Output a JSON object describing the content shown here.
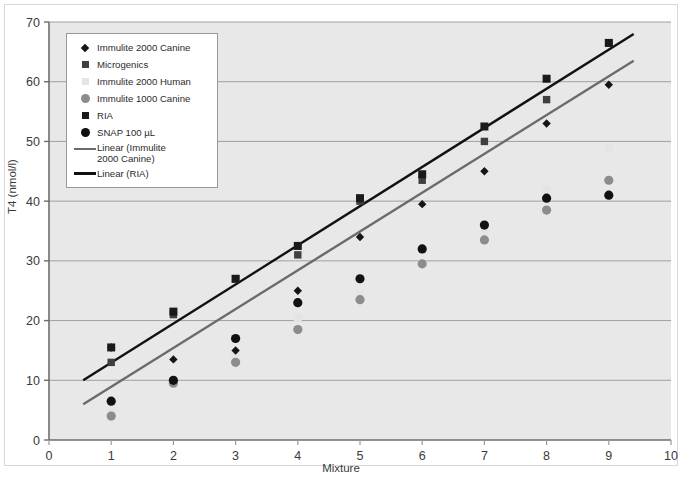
{
  "chart_data": {
    "type": "scatter",
    "title": "",
    "xlabel": "Mixture",
    "ylabel": "T4 (nmol/l)",
    "xlim": [
      0,
      10
    ],
    "ylim": [
      0,
      70
    ],
    "xticks": [
      0,
      1,
      2,
      3,
      4,
      5,
      6,
      7,
      8,
      9,
      10
    ],
    "yticks": [
      0,
      10,
      20,
      30,
      40,
      50,
      60,
      70
    ],
    "grid": "horizontal",
    "legend_position": "upper-left-inside",
    "x": [
      1,
      2,
      3,
      4,
      5,
      6,
      7,
      8,
      9
    ],
    "series": [
      {
        "name": "Immulite 2000 Canine",
        "marker": "diamond",
        "color": "#151515",
        "values": [
          15.5,
          13.5,
          15.0,
          25.0,
          34.0,
          39.5,
          45.0,
          53.0,
          59.5
        ]
      },
      {
        "name": "Microgenics",
        "marker": "square",
        "color": "#3f3f3f",
        "values": [
          13.0,
          21.0,
          27.0,
          31.0,
          40.0,
          43.5,
          50.0,
          57.0,
          66.5
        ]
      },
      {
        "name": "Immulite 2000 Human",
        "marker": "square",
        "color": "#e4e4e4",
        "values": [
          4.5,
          10.0,
          14.0,
          20.5,
          24.5,
          29.5,
          35.0,
          42.0,
          49.0
        ]
      },
      {
        "name": "Immulite 1000 Canine",
        "marker": "circle",
        "color": "#8c8c8c",
        "values": [
          4.0,
          9.5,
          13.0,
          18.5,
          23.5,
          29.5,
          33.5,
          38.5,
          43.5
        ]
      },
      {
        "name": "RIA",
        "marker": "square",
        "color": "#1a1a1a",
        "values": [
          15.5,
          21.5,
          27.0,
          32.5,
          40.5,
          44.5,
          52.5,
          60.5,
          66.5
        ]
      },
      {
        "name": "SNAP 100 µL",
        "marker": "circle",
        "color": "#111111",
        "values": [
          6.5,
          10.0,
          17.0,
          23.0,
          27.0,
          32.0,
          36.0,
          40.5,
          41.0
        ]
      }
    ],
    "trendlines": [
      {
        "name": "Linear (Immulite 2000 Canine)",
        "color": "#6b6b6b",
        "x0": 0.55,
        "y0": 6.0,
        "x1": 9.4,
        "y1": 63.5
      },
      {
        "name": "Linear (RIA)",
        "color": "#111111",
        "x0": 0.55,
        "y0": 10.0,
        "x1": 9.4,
        "y1": 68.0
      }
    ]
  },
  "legend": {
    "items": [
      {
        "label": "Immulite 2000 Canine",
        "marker": "diamond-icon",
        "color": "#151515"
      },
      {
        "label": "Microgenics",
        "marker": "square-icon",
        "color": "#3f3f3f"
      },
      {
        "label": "Immulite 2000 Human",
        "marker": "square-icon",
        "color": "#e4e4e4"
      },
      {
        "label": "Immulite 1000 Canine",
        "marker": "circle-icon",
        "color": "#8c8c8c"
      },
      {
        "label": "RIA",
        "marker": "square-icon",
        "color": "#1a1a1a"
      },
      {
        "label": "SNAP 100 µL",
        "marker": "circle-icon",
        "color": "#111111"
      },
      {
        "label": "Linear (Immulite 2000 Canine)",
        "marker": "line-icon",
        "color": "#6b6b6b",
        "wrap": [
          "Linear (Immulite",
          "2000 Canine)"
        ]
      },
      {
        "label": "Linear (RIA)",
        "marker": "line-icon",
        "color": "#111111"
      }
    ]
  },
  "colors": {
    "plot_background": "#e8e8e8",
    "gridline": "#a0a0a0",
    "axis": "#6e6e6e",
    "page_background": "#ffffff"
  }
}
